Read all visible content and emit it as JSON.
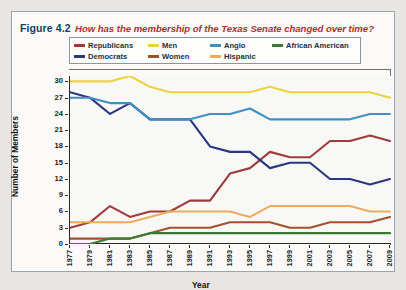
{
  "figure": {
    "number": "Figure 4.2",
    "question": "How has the membership of the Texas Senate changed over time?"
  },
  "legend": {
    "items": [
      {
        "label": "Republicans",
        "color": "#9e3b3b"
      },
      {
        "label": "Men",
        "color": "#edd23f"
      },
      {
        "label": "Anglo",
        "color": "#3f8fc4"
      },
      {
        "label": "African American",
        "color": "#3c7a33"
      },
      {
        "label": "Democrats",
        "color": "#2a3680"
      },
      {
        "label": "Women",
        "color": "#a0522d"
      },
      {
        "label": "Hispanic",
        "color": "#edab5e"
      }
    ]
  },
  "chart_data": {
    "type": "line",
    "title": "How has the membership of the Texas Senate changed over time?",
    "xlabel": "Year",
    "ylabel": "Number of Members",
    "x": [
      1977,
      1979,
      1981,
      1983,
      1985,
      1987,
      1989,
      1991,
      1993,
      1995,
      1997,
      1999,
      2001,
      2003,
      2005,
      2007,
      2009
    ],
    "xlim": [
      1977,
      2009
    ],
    "ylim": [
      0,
      31
    ],
    "yticks": [
      0,
      3,
      6,
      9,
      12,
      15,
      18,
      21,
      24,
      27,
      30
    ],
    "xticks": [
      "1977",
      "1979",
      "1981",
      "1983",
      "1985",
      "1987",
      "1989",
      "1991",
      "1993",
      "1995",
      "1997",
      "1999",
      "2001",
      "2003",
      "2005",
      "2007",
      "2009"
    ],
    "grid": false,
    "legend_position": "top",
    "series": [
      {
        "name": "Republicans",
        "color": "#9e3b3b",
        "values": [
          3,
          4,
          7,
          5,
          6,
          6,
          8,
          8,
          13,
          14,
          17,
          16,
          16,
          19,
          19,
          20,
          19
        ]
      },
      {
        "name": "Democrats",
        "color": "#2a3680",
        "values": [
          28,
          27,
          24,
          26,
          23,
          23,
          23,
          18,
          17,
          17,
          14,
          15,
          15,
          12,
          12,
          11,
          12
        ]
      },
      {
        "name": "Men",
        "color": "#edd23f",
        "values": [
          30,
          30,
          30,
          31,
          29,
          28,
          28,
          28,
          28,
          28,
          29,
          28,
          28,
          28,
          28,
          28,
          27
        ]
      },
      {
        "name": "Women",
        "color": "#a0522d",
        "values": [
          1,
          1,
          1,
          1,
          2,
          3,
          3,
          3,
          4,
          4,
          4,
          3,
          3,
          4,
          4,
          4,
          5
        ]
      },
      {
        "name": "Anglo",
        "color": "#3f8fc4",
        "values": [
          27,
          27,
          26,
          26,
          23,
          23,
          23,
          24,
          24,
          25,
          23,
          23,
          23,
          23,
          23,
          24,
          24
        ]
      },
      {
        "name": "Hispanic",
        "color": "#edab5e",
        "values": [
          4,
          4,
          4,
          4,
          5,
          6,
          6,
          6,
          6,
          5,
          7,
          7,
          7,
          7,
          7,
          6,
          6
        ]
      },
      {
        "name": "African American",
        "color": "#3c7a33",
        "values": [
          0,
          0,
          1,
          1,
          2,
          2,
          2,
          2,
          2,
          2,
          2,
          2,
          2,
          2,
          2,
          2,
          2
        ]
      }
    ]
  }
}
